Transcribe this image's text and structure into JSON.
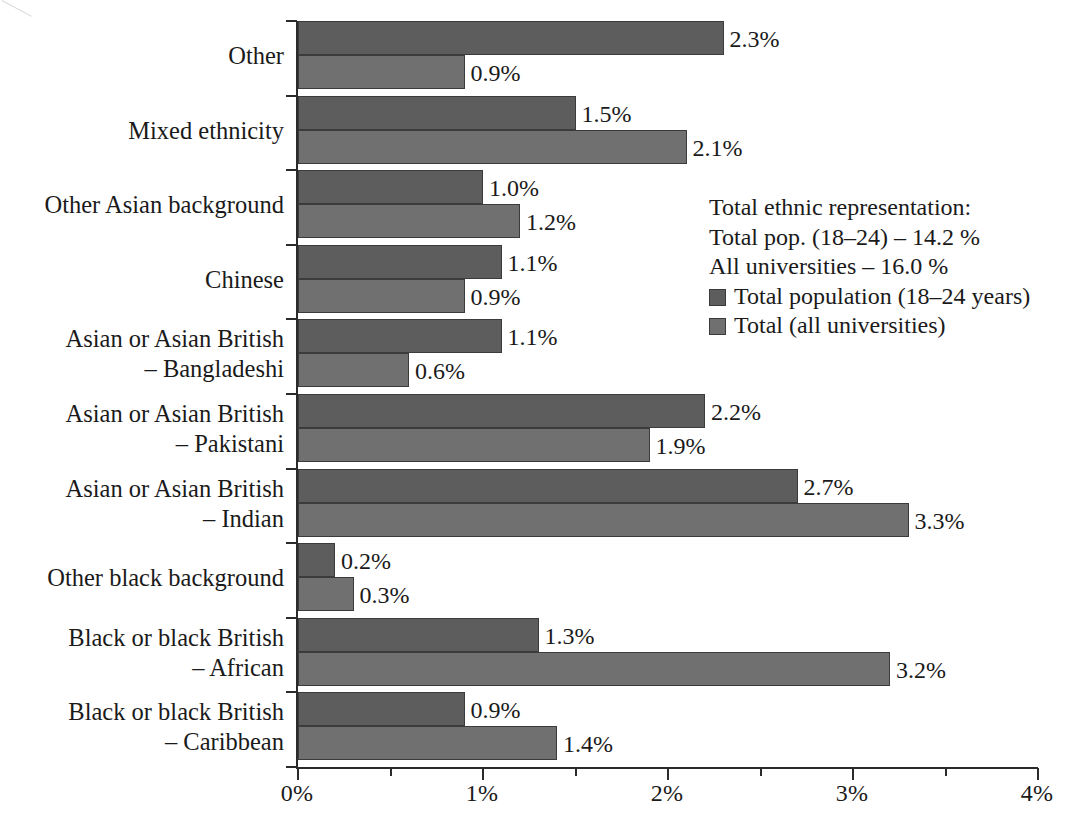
{
  "chart_data": {
    "type": "bar",
    "orientation": "horizontal",
    "title": "",
    "xlabel": "",
    "ylabel": "",
    "xlim": [
      0,
      4
    ],
    "xunit": "%",
    "grid": false,
    "legend_position": "inside-right",
    "xticks": [
      "0%",
      "1%",
      "2%",
      "3%",
      "4%"
    ],
    "xtick_values": [
      0,
      1,
      2,
      3,
      4
    ],
    "minor_tick_values": [
      0.5,
      1.5,
      2.5,
      3.5
    ],
    "categories": [
      "Other",
      "Mixed ethnicity",
      "Other Asian background",
      "Chinese",
      "Asian or Asian British\n– Bangladeshi",
      "Asian or Asian British\n– Pakistani",
      "Asian or Asian British\n– Indian",
      "Other black background",
      "Black or black British\n– African",
      "Black or black British\n– Caribbean"
    ],
    "series": [
      {
        "name": "Total population (18–24 years)",
        "color": "#5d5d5d",
        "values": [
          2.3,
          1.5,
          1.0,
          1.1,
          1.1,
          2.2,
          2.7,
          0.2,
          1.3,
          0.9
        ],
        "labels": [
          "2.3%",
          "1.5%",
          "1.0%",
          "1.1%",
          "1.1%",
          "2.2%",
          "2.7%",
          "0.2%",
          "1.3%",
          "0.9%"
        ]
      },
      {
        "name": "Total (all universities)",
        "color": "#707070",
        "values": [
          0.9,
          2.1,
          1.2,
          0.9,
          0.6,
          1.9,
          3.3,
          0.3,
          3.2,
          1.4
        ],
        "labels": [
          "0.9%",
          "2.1%",
          "1.2%",
          "0.9%",
          "0.6%",
          "1.9%",
          "3.3%",
          "0.3%",
          "3.2%",
          "1.4%"
        ]
      }
    ],
    "annotations": [
      "Total ethnic representation:",
      "Total pop. (18–24) – 14.2 %",
      "All universities – 16.0 %"
    ]
  },
  "legend": {
    "heading": "Total ethnic representation:",
    "summary_total_population": "Total pop. (18–24) – 14.2 %",
    "summary_all_universities": "All universities – 16.0 %",
    "entries": [
      {
        "label": "Total population (18–24 years)",
        "color": "#5d5d5d"
      },
      {
        "label": "Total (all universities)",
        "color": "#707070"
      }
    ]
  }
}
